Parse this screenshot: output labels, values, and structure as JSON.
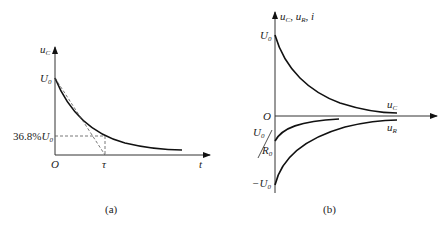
{
  "figure_a": {
    "caption": "(a)",
    "y_axis_label": "u",
    "y_axis_label_sub": "C",
    "x_axis_label": "t",
    "origin_label": "O",
    "u0_label": "U",
    "u0_label_sub": "0",
    "level_label_prefix": "36.8%",
    "level_label_var": "U",
    "level_label_sub": "0",
    "tau_label": "τ",
    "level_fraction": 0.368
  },
  "figure_b": {
    "caption": "(b)",
    "y_axis_label": "u",
    "y_axis_label_parts": [
      "C",
      ", u",
      "R",
      ", i"
    ],
    "origin_label": "O",
    "u0_label": "U",
    "u0_label_sub": "0",
    "neg_u0_label": "−U",
    "neg_u0_label_sub": "0",
    "current_label_num": "U",
    "current_label_num_sub": "0",
    "current_label_den": "R",
    "current_label_den_sub": "0",
    "curve_uc_label": "u",
    "curve_uc_label_sub": "C",
    "curve_ur_label": "u",
    "curve_ur_label_sub": "R"
  }
}
